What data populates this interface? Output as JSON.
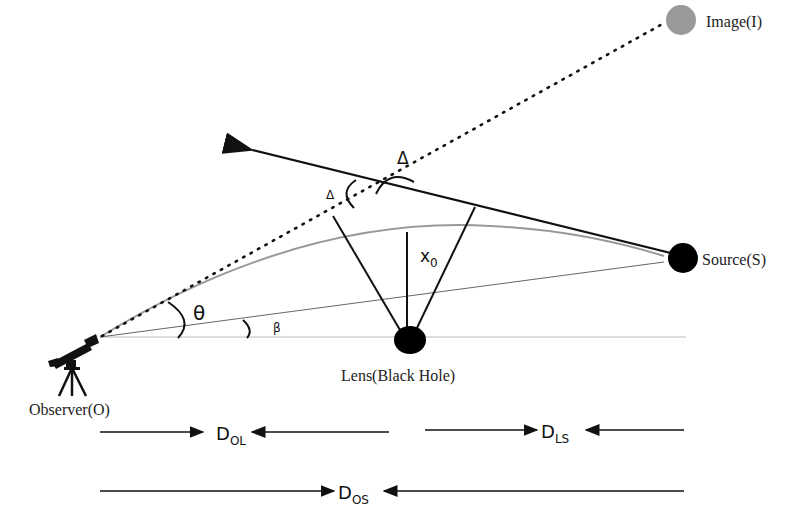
{
  "diagram": {
    "type": "gravitational-lensing-geometry",
    "nodes": {
      "observer": {
        "label": "Observer(O)",
        "x": 100,
        "y": 337
      },
      "lens": {
        "label": "Lens(Black Hole)",
        "x": 410,
        "y": 340
      },
      "source": {
        "label": "Source(S)",
        "x": 683,
        "y": 257
      },
      "image": {
        "label": "Image(I)",
        "x": 681,
        "y": 20
      }
    },
    "angles": {
      "theta": "θ",
      "beta": "β",
      "delta_large": "Δ",
      "delta_small": "Δ"
    },
    "labels": {
      "impact": "x",
      "impact_sub": "0"
    },
    "distances": {
      "ol": {
        "main": "D",
        "sub": "OL"
      },
      "ls": {
        "main": "D",
        "sub": "LS"
      },
      "os": {
        "main": "D",
        "sub": "OS"
      }
    },
    "colors": {
      "line": "#111111",
      "thin_line": "#666666",
      "curve": "#999999",
      "image_fill": "#999999",
      "body_fill": "#000000"
    }
  }
}
